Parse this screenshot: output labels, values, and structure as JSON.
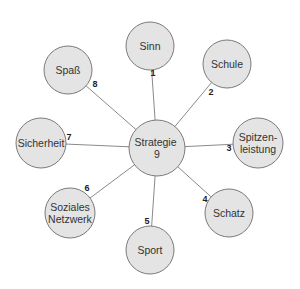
{
  "diagram": {
    "type": "hub-and-spoke",
    "colors": {
      "node_fill": "#e4e4e4",
      "node_stroke": "#7a7a7a",
      "edge": "#8a8a8a",
      "text": "#333333"
    },
    "center": {
      "lines": [
        "Strategie",
        "9"
      ],
      "cx": 157,
      "cy": 148,
      "r": 28
    },
    "nodes": [
      {
        "id": "sinn",
        "number": "1",
        "lines": [
          "Sinn"
        ],
        "cx": 150,
        "cy": 46,
        "r": 24,
        "num_x": 153,
        "num_y": 76,
        "edge_x2": 150,
        "edge_y2": 70
      },
      {
        "id": "schule",
        "number": "2",
        "lines": [
          "Schule"
        ],
        "cx": 227,
        "cy": 64,
        "r": 24,
        "num_x": 211,
        "num_y": 95,
        "edge_x2": 211,
        "edge_y2": 82
      },
      {
        "id": "spitzenleistung",
        "number": "3",
        "lines": [
          "Spitzen-",
          "leistung"
        ],
        "cx": 258,
        "cy": 143,
        "r": 25,
        "num_x": 229,
        "num_y": 151,
        "edge_x2": 233,
        "edge_y2": 143
      },
      {
        "id": "schatz",
        "number": "4",
        "lines": [
          "Schatz"
        ],
        "cx": 229,
        "cy": 213,
        "r": 24,
        "num_x": 205,
        "num_y": 202,
        "edge_x2": 211,
        "edge_y2": 197
      },
      {
        "id": "sport",
        "number": "5",
        "lines": [
          "Sport"
        ],
        "cx": 150,
        "cy": 250,
        "r": 24,
        "num_x": 147,
        "num_y": 224,
        "edge_x2": 150,
        "edge_y2": 226
      },
      {
        "id": "soziales-netzwerk",
        "number": "6",
        "lines": [
          "Soziales",
          "Netzwerk"
        ],
        "cx": 70,
        "cy": 213,
        "r": 25,
        "num_x": 87,
        "num_y": 191,
        "edge_x2": 88,
        "edge_y2": 196
      },
      {
        "id": "sicherheit",
        "number": "7",
        "lines": [
          "Sicherheit"
        ],
        "cx": 41,
        "cy": 143,
        "r": 25,
        "num_x": 69,
        "num_y": 140,
        "edge_x2": 66,
        "edge_y2": 143
      },
      {
        "id": "spass",
        "number": "8",
        "lines": [
          "Spaß"
        ],
        "cx": 68,
        "cy": 70,
        "r": 24,
        "num_x": 95,
        "num_y": 87,
        "edge_x2": 86,
        "edge_y2": 87
      }
    ]
  }
}
